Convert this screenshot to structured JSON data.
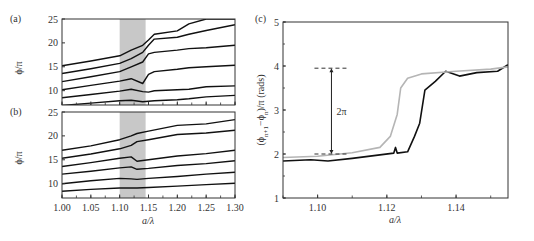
{
  "chart_data": [
    {
      "panel": "(a)",
      "type": "line",
      "xlabel": "",
      "ylabel": "ϕ/π",
      "xlim": [
        1.0,
        1.3
      ],
      "ylim": [
        7,
        25
      ],
      "yticks": [
        "10",
        "15",
        "20",
        "25"
      ],
      "ytick_values": [
        10,
        15,
        20,
        25
      ],
      "shaded_region": {
        "x0": 1.1,
        "x1": 1.145,
        "color": "#c8c8c8"
      },
      "x": [
        1.0,
        1.05,
        1.1,
        1.12,
        1.14,
        1.15,
        1.16,
        1.2,
        1.22,
        1.25,
        1.3
      ],
      "series": [
        {
          "name": "mode 1",
          "values": [
            15.2,
            16.2,
            17.3,
            18.5,
            19.5,
            20.6,
            21.8,
            22.5,
            24.0,
            25.0,
            25.0
          ]
        },
        {
          "name": "mode 2",
          "values": [
            13.6,
            14.6,
            15.7,
            16.7,
            18.0,
            19.5,
            20.8,
            21.2,
            21.8,
            22.6,
            23.8
          ]
        },
        {
          "name": "mode 3",
          "values": [
            11.9,
            12.9,
            14.0,
            15.0,
            16.0,
            17.7,
            18.0,
            18.5,
            18.8,
            19.0,
            19.5
          ]
        },
        {
          "name": "mode 4",
          "values": [
            10.2,
            11.1,
            12.0,
            12.5,
            11.5,
            13.4,
            14.0,
            14.5,
            14.8,
            15.0,
            15.3
          ]
        },
        {
          "name": "mode 5",
          "values": [
            8.5,
            9.2,
            9.9,
            10.3,
            9.8,
            9.7,
            10.0,
            10.2,
            10.3,
            10.8,
            11.0
          ]
        },
        {
          "name": "mode 6",
          "values": [
            6.9,
            7.4,
            7.9,
            8.0,
            7.7,
            7.8,
            7.9,
            8.1,
            8.3,
            8.7,
            9.0
          ]
        }
      ]
    },
    {
      "panel": "(b)",
      "type": "line",
      "xlabel": "a/λ",
      "ylabel": "ϕ/π",
      "xlim": [
        1.0,
        1.3
      ],
      "ylim": [
        7,
        25
      ],
      "xticks": [
        "1.00",
        "1.05",
        "1.10",
        "1.15",
        "1.20",
        "1.25",
        "1.30"
      ],
      "xtick_values": [
        1.0,
        1.05,
        1.1,
        1.15,
        1.2,
        1.25,
        1.3
      ],
      "yticks": [
        "10",
        "15",
        "20",
        "25"
      ],
      "ytick_values": [
        10,
        15,
        20,
        25
      ],
      "shaded_region": {
        "x0": 1.1,
        "x1": 1.145,
        "color": "#c8c8c8"
      },
      "x": [
        1.0,
        1.05,
        1.1,
        1.12,
        1.13,
        1.15,
        1.2,
        1.25,
        1.3
      ],
      "series": [
        {
          "name": "mode 1",
          "values": [
            17.0,
            17.9,
            19.2,
            20.0,
            20.5,
            21.0,
            22.2,
            22.5,
            23.4
          ]
        },
        {
          "name": "mode 2",
          "values": [
            15.3,
            16.2,
            17.3,
            18.0,
            18.8,
            19.2,
            20.3,
            20.6,
            21.2
          ]
        },
        {
          "name": "mode 3",
          "values": [
            13.6,
            14.4,
            15.3,
            15.6,
            14.7,
            15.0,
            15.8,
            16.3,
            17.0
          ]
        },
        {
          "name": "mode 4",
          "values": [
            12.0,
            12.6,
            13.3,
            13.5,
            13.0,
            13.2,
            13.8,
            14.2,
            14.8
          ]
        },
        {
          "name": "mode 5",
          "values": [
            10.0,
            10.6,
            11.1,
            11.0,
            10.9,
            11.1,
            11.5,
            12.0,
            12.4
          ]
        },
        {
          "name": "mode 6",
          "values": [
            8.4,
            8.8,
            9.1,
            9.1,
            9.1,
            9.2,
            9.5,
            9.8,
            10.1
          ]
        }
      ]
    },
    {
      "panel": "(c)",
      "type": "line",
      "xlabel": "a/λ",
      "ylabel": "(ϕn+1−ϕn)/π (rads)",
      "xlim": [
        1.09,
        1.155
      ],
      "ylim": [
        1,
        5
      ],
      "xticks": [
        "1.10",
        "1.12",
        "1.14"
      ],
      "xtick_values": [
        1.1,
        1.12,
        1.14
      ],
      "yticks": [
        "1",
        "2",
        "3",
        "4",
        "5"
      ],
      "ytick_values": [
        1,
        2,
        3,
        4,
        5
      ],
      "annotation": {
        "text": "2π",
        "x": 1.104,
        "y_from": 2.0,
        "y_to": 3.95
      },
      "series": [
        {
          "name": "black",
          "color": "#111111",
          "x": [
            1.09,
            1.098,
            1.103,
            1.11,
            1.118,
            1.122,
            1.1225,
            1.123,
            1.126,
            1.128,
            1.1295,
            1.131,
            1.134,
            1.137,
            1.141,
            1.146,
            1.152,
            1.155
          ],
          "values": [
            1.84,
            1.87,
            1.84,
            1.9,
            1.98,
            2.02,
            2.15,
            2.02,
            2.05,
            2.4,
            2.7,
            3.45,
            3.65,
            3.88,
            3.77,
            3.85,
            3.88,
            4.03
          ]
        },
        {
          "name": "gray",
          "color": "#b5b5b5",
          "x": [
            1.09,
            1.1,
            1.11,
            1.118,
            1.121,
            1.123,
            1.124,
            1.126,
            1.13,
            1.14,
            1.15,
            1.155
          ],
          "values": [
            1.92,
            1.95,
            2.03,
            2.15,
            2.4,
            2.9,
            3.5,
            3.72,
            3.82,
            3.88,
            3.93,
            3.98
          ]
        }
      ]
    }
  ],
  "labels": {
    "panel_a": "(a)",
    "panel_b": "(b)",
    "panel_c": "(c)",
    "ylabel_ab": "ϕ/π",
    "xlabel_b": "a/λ",
    "xlabel_c": "a/λ",
    "ylabel_c": "(ϕn+1−ϕn)/π (rads)",
    "annotation_c": "2π"
  }
}
